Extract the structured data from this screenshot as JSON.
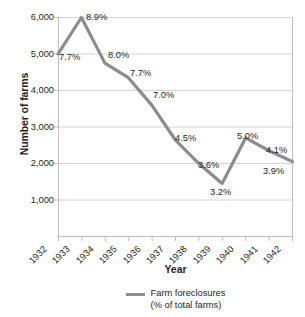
{
  "chart_data": {
    "type": "line",
    "title": "",
    "xlabel": "Year",
    "ylabel": "Number of farms",
    "categories": [
      "1932",
      "1933",
      "1934",
      "1935",
      "1936",
      "1937",
      "1938",
      "1939",
      "1940",
      "1941",
      "1942"
    ],
    "series": [
      {
        "name": "Farm foreclosures (% of total farms)",
        "values": [
          5000,
          6000,
          4750,
          4350,
          3600,
          2650,
          2000,
          1450,
          2700,
          2350,
          2050
        ],
        "point_labels": [
          "7.7%",
          "8.9%",
          "8.0%",
          "7.7%",
          "7.0%",
          "4.5%",
          "3.6%",
          "3.2%",
          "5.0%",
          "4.1%",
          "3.9%"
        ],
        "color": "#8c8c8c"
      }
    ],
    "ylim": [
      0,
      6000
    ],
    "yticks": [
      1000,
      2000,
      3000,
      4000,
      5000,
      6000
    ],
    "ytick_labels": [
      "1,000",
      "2,000",
      "3,000",
      "4,000",
      "5,000",
      "6,000"
    ],
    "grid": true,
    "legend_position": "bottom",
    "legend": [
      {
        "label_line1": "Farm foreclosures",
        "label_line2": "(% of total farms)",
        "color": "#8c8c8c"
      }
    ]
  },
  "axes": {
    "y_title": "Number of farms",
    "x_title": "Year"
  },
  "colors": {
    "line": "#8c8c8c",
    "grid": "#d4d4d4",
    "axis": "#bdbdbd",
    "text": "#231f20"
  }
}
